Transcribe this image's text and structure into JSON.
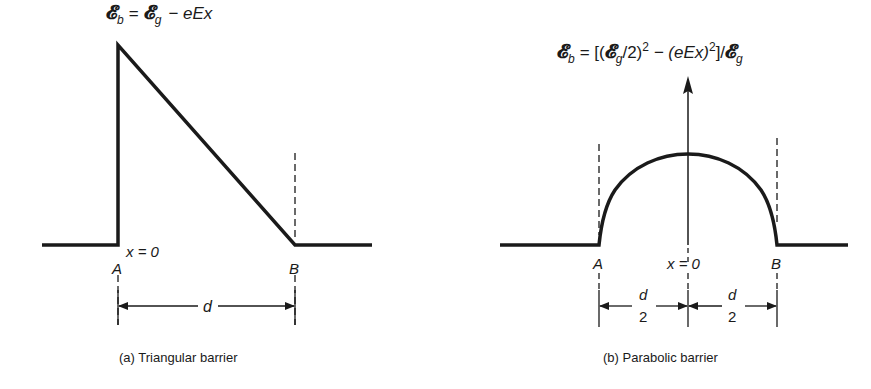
{
  "figure_a": {
    "equation": {
      "lhs_symbol": "𝓔",
      "lhs_sub": "b",
      "equals": "=",
      "rhs_symbol": "𝓔",
      "rhs_sub": "g",
      "rhs_rest": "− eEx"
    },
    "origin_label": "x = 0",
    "point_a": "A",
    "point_b": "B",
    "width_label": "d",
    "caption": "(a)  Triangular barrier"
  },
  "figure_b": {
    "equation": {
      "lhs_symbol": "𝓔",
      "lhs_sub": "b",
      "part1": "= [(",
      "sym2": "𝓔",
      "sub2": "g",
      "part2": "/2)",
      "sup1": "2",
      "part3": " − (eEx)",
      "sup2": "2",
      "part4": "]/",
      "sym3": "𝓔",
      "sub3": "g"
    },
    "origin_label": "x = 0",
    "point_a": "A",
    "point_b": "B",
    "half_width_num": "d",
    "half_width_den": "2",
    "caption": "(b)  Parabolic barrier"
  }
}
